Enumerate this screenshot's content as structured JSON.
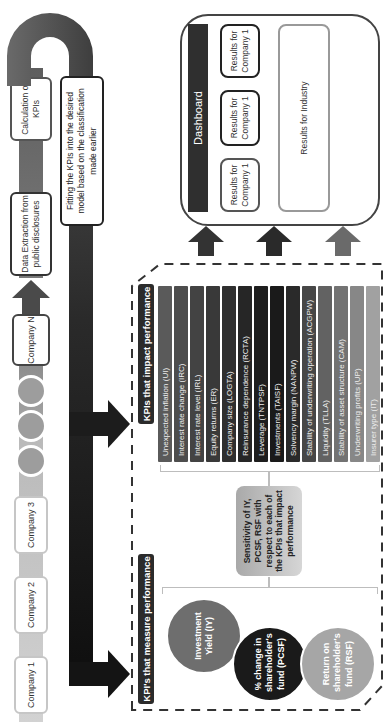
{
  "process": {
    "companies": [
      {
        "label": "Company 1"
      },
      {
        "label": "Company 2"
      },
      {
        "label": "Company 3"
      },
      {
        "label": "Company N"
      }
    ],
    "ellipsis_dots": 3,
    "steps": {
      "data_extraction": "Data Extraction from public disclosures",
      "calculation": "Calculation of KPIs",
      "fitting": "Fitting the KPIs into the desired model based on the classification made earlier"
    }
  },
  "kpi_panel": {
    "impact_title": "KPIs that impact performance",
    "impact_kpis": [
      {
        "label": "Unexpected inflation (UI)",
        "color": "#5a5a5a"
      },
      {
        "label": "Interest rate change (IRC)",
        "color": "#4d4d4d"
      },
      {
        "label": "Interest rate level (IRL)",
        "color": "#434343"
      },
      {
        "label": "Equity returns (ER)",
        "color": "#393939"
      },
      {
        "label": "Company size (LOGTA)",
        "color": "#2f2f2f"
      },
      {
        "label": "Reinsurance dependence (RCTA)",
        "color": "#262626"
      },
      {
        "label": "Leverage (TNTPSF)",
        "color": "#1e1e1e"
      },
      {
        "label": "Investments (TAISF)",
        "color": "#1a1a1a"
      },
      {
        "label": "Solvency margin (NANPW)",
        "color": "#2a2a2a"
      },
      {
        "label": "Stability of underwriting operation (ACGPW)",
        "color": "#474747"
      },
      {
        "label": "Liquidity (TLLA)",
        "color": "#626262"
      },
      {
        "label": "Stability of asset structure (CAM)",
        "color": "#737373"
      },
      {
        "label": "Underwriting profits (UP)",
        "color": "#878787"
      },
      {
        "label": "Insurer type (IT)",
        "color": "#a1a1a1"
      }
    ],
    "sensitivity_text": "Sensitivity of IY, PCSF, RSF with respect to each of the KPIs that impact performance",
    "measure_title": "KPI's that measure performance",
    "measure_kpis": [
      {
        "label": "Investment Yield (IY)",
        "color": "#6e6e6e"
      },
      {
        "label": "% change in shareholder's fund (PCSF)",
        "color": "#1a1a1a"
      },
      {
        "label": "Return on shareholder's fund (RSF)",
        "color": "#a6a6a6"
      }
    ]
  },
  "dashboard": {
    "title": "Dashboard",
    "company_results": [
      {
        "label": "Results for Company 1"
      },
      {
        "label": "Results for Company 1"
      },
      {
        "label": "Results for Company 1"
      }
    ],
    "industry_result": "Results for Industry"
  },
  "colors": {
    "pipe_light": "#c8c8c8",
    "pipe_dark": "#5a5a5a",
    "arrow_dark": "#2a2a2a",
    "panel_border": "#333333"
  }
}
